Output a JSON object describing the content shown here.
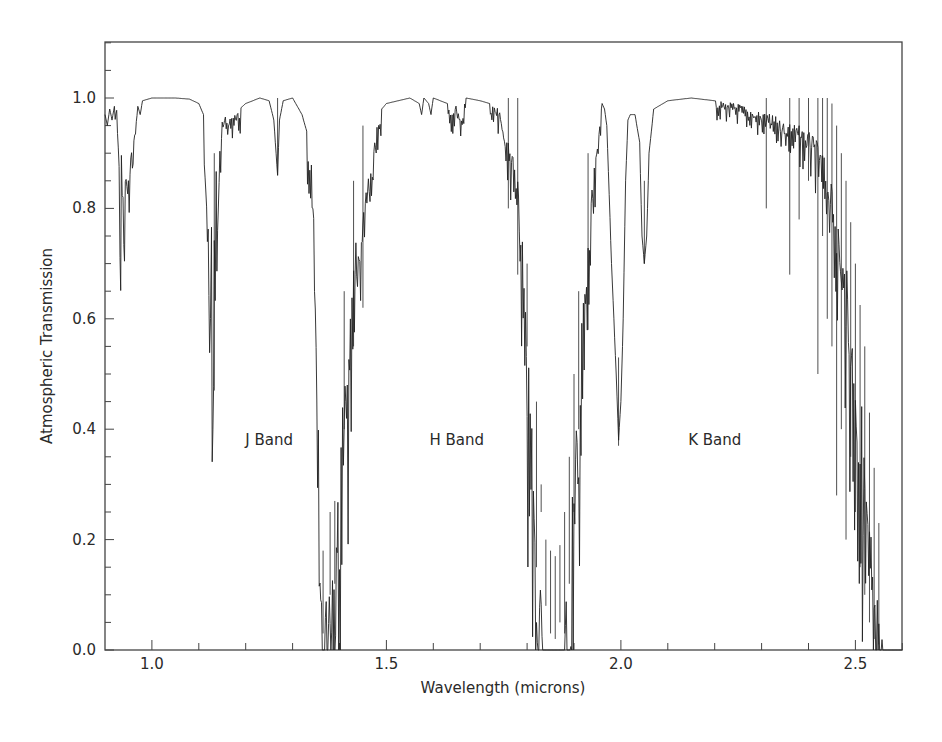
{
  "chart_data": {
    "type": "line",
    "title": "",
    "xlabel": "Wavelength (microns)",
    "ylabel": "Atmospheric Transmission",
    "xlim": [
      0.9,
      2.6
    ],
    "ylim": [
      0.0,
      1.1
    ],
    "grid": false,
    "legend": null,
    "x_ticks": [
      {
        "value": 1.0,
        "label": "1.0"
      },
      {
        "value": 1.5,
        "label": "1.5"
      },
      {
        "value": 2.0,
        "label": "2.0"
      },
      {
        "value": 2.5,
        "label": "2.5"
      }
    ],
    "x_minor_step": 0.1,
    "y_ticks": [
      {
        "value": 0.0,
        "label": "0.0"
      },
      {
        "value": 0.2,
        "label": "0.2"
      },
      {
        "value": 0.4,
        "label": "0.4"
      },
      {
        "value": 0.6,
        "label": "0.6"
      },
      {
        "value": 0.8,
        "label": "0.8"
      },
      {
        "value": 1.0,
        "label": "1.0"
      }
    ],
    "y_minor_step": 0.05,
    "annotations": [
      {
        "text": "J Band",
        "x": 1.25,
        "y": 0.38
      },
      {
        "text": "H Band",
        "x": 1.65,
        "y": 0.38
      },
      {
        "text": "K Band",
        "x": 2.2,
        "y": 0.38
      }
    ],
    "series": [
      {
        "name": "Atmospheric Transmission",
        "color": "#222222",
        "envelope": [
          [
            0.9,
            0.97
          ],
          [
            0.905,
            0.95
          ],
          [
            0.91,
            0.98
          ],
          [
            0.915,
            0.96
          ],
          [
            0.92,
            0.985
          ],
          [
            0.925,
            0.98
          ],
          [
            0.93,
            0.9
          ],
          [
            0.932,
            0.72
          ],
          [
            0.935,
            0.92
          ],
          [
            0.94,
            0.8
          ],
          [
            0.945,
            0.88
          ],
          [
            0.95,
            0.86
          ],
          [
            0.955,
            0.9
          ],
          [
            0.96,
            0.92
          ],
          [
            0.965,
            0.96
          ],
          [
            0.97,
            0.985
          ],
          [
            0.975,
            0.97
          ],
          [
            0.98,
            0.995
          ],
          [
            1.0,
            1.0
          ],
          [
            1.05,
            1.0
          ],
          [
            1.08,
            0.998
          ],
          [
            1.1,
            0.99
          ],
          [
            1.11,
            0.97
          ],
          [
            1.115,
            0.85
          ],
          [
            1.12,
            0.8
          ],
          [
            1.123,
            0.62
          ],
          [
            1.127,
            0.78
          ],
          [
            1.13,
            0.47
          ],
          [
            1.133,
            0.75
          ],
          [
            1.137,
            0.88
          ],
          [
            1.14,
            0.8
          ],
          [
            1.145,
            0.92
          ],
          [
            1.15,
            0.96
          ],
          [
            1.16,
            0.97
          ],
          [
            1.18,
            0.975
          ],
          [
            1.2,
            0.99
          ],
          [
            1.23,
            1.0
          ],
          [
            1.25,
            0.995
          ],
          [
            1.26,
            0.96
          ],
          [
            1.268,
            0.86
          ],
          [
            1.272,
            0.96
          ],
          [
            1.28,
            0.995
          ],
          [
            1.3,
            1.0
          ],
          [
            1.31,
            0.985
          ],
          [
            1.32,
            0.97
          ],
          [
            1.33,
            0.94
          ],
          [
            1.34,
            0.88
          ],
          [
            1.345,
            0.8
          ],
          [
            1.35,
            0.65
          ],
          [
            1.355,
            0.4
          ],
          [
            1.36,
            0.22
          ],
          [
            1.365,
            0.03
          ],
          [
            1.37,
            0.2
          ],
          [
            1.38,
            0.1
          ],
          [
            1.385,
            0.3
          ],
          [
            1.39,
            0.12
          ],
          [
            1.4,
            0.35
          ],
          [
            1.41,
            0.5
          ],
          [
            1.42,
            0.55
          ],
          [
            1.43,
            0.7
          ],
          [
            1.44,
            0.78
          ],
          [
            1.45,
            0.8
          ],
          [
            1.46,
            0.85
          ],
          [
            1.47,
            0.9
          ],
          [
            1.48,
            0.96
          ],
          [
            1.49,
            0.98
          ],
          [
            1.5,
            0.99
          ],
          [
            1.55,
            1.0
          ],
          [
            1.57,
            0.99
          ],
          [
            1.575,
            0.97
          ],
          [
            1.58,
            1.0
          ],
          [
            1.59,
            0.99
          ],
          [
            1.595,
            0.97
          ],
          [
            1.6,
            1.0
          ],
          [
            1.63,
            0.99
          ],
          [
            1.64,
            0.98
          ],
          [
            1.65,
            0.99
          ],
          [
            1.66,
            0.97
          ],
          [
            1.67,
            1.0
          ],
          [
            1.7,
            0.995
          ],
          [
            1.72,
            0.99
          ],
          [
            1.74,
            0.98
          ],
          [
            1.75,
            0.95
          ],
          [
            1.77,
            0.9
          ],
          [
            1.78,
            0.85
          ],
          [
            1.79,
            0.75
          ],
          [
            1.8,
            0.55
          ],
          [
            1.81,
            0.45
          ],
          [
            1.82,
            0.3
          ],
          [
            1.83,
            0.15
          ],
          [
            1.84,
            0.05
          ],
          [
            1.85,
            0.03
          ],
          [
            1.86,
            0.02
          ],
          [
            1.87,
            0.04
          ],
          [
            1.88,
            0.1
          ],
          [
            1.89,
            0.2
          ],
          [
            1.9,
            0.35
          ],
          [
            1.91,
            0.5
          ],
          [
            1.92,
            0.65
          ],
          [
            1.93,
            0.75
          ],
          [
            1.94,
            0.85
          ],
          [
            1.95,
            0.92
          ],
          [
            1.955,
            0.97
          ],
          [
            1.96,
            0.99
          ],
          [
            1.965,
            0.98
          ],
          [
            1.97,
            0.95
          ],
          [
            1.98,
            0.7
          ],
          [
            1.99,
            0.5
          ],
          [
            1.995,
            0.38
          ],
          [
            2.0,
            0.45
          ],
          [
            2.005,
            0.6
          ],
          [
            2.01,
            0.85
          ],
          [
            2.015,
            0.96
          ],
          [
            2.02,
            0.97
          ],
          [
            2.03,
            0.97
          ],
          [
            2.04,
            0.92
          ],
          [
            2.045,
            0.75
          ],
          [
            2.05,
            0.7
          ],
          [
            2.055,
            0.75
          ],
          [
            2.06,
            0.9
          ],
          [
            2.07,
            0.98
          ],
          [
            2.1,
            0.995
          ],
          [
            2.15,
            1.0
          ],
          [
            2.2,
            0.995
          ],
          [
            2.25,
            0.99
          ],
          [
            2.28,
            0.98
          ],
          [
            2.3,
            0.975
          ],
          [
            2.32,
            0.97
          ],
          [
            2.35,
            0.96
          ],
          [
            2.38,
            0.95
          ],
          [
            2.4,
            0.94
          ],
          [
            2.42,
            0.92
          ],
          [
            2.44,
            0.88
          ],
          [
            2.46,
            0.8
          ],
          [
            2.48,
            0.7
          ],
          [
            2.5,
            0.55
          ],
          [
            2.52,
            0.4
          ],
          [
            2.53,
            0.28
          ],
          [
            2.54,
            0.18
          ],
          [
            2.55,
            0.08
          ],
          [
            2.56,
            0.03
          ],
          [
            2.57,
            0.01
          ],
          [
            2.58,
            0.0
          ],
          [
            2.6,
            0.0
          ]
        ],
        "absorption_lines": [
          [
            1.133,
            0.47
          ],
          [
            1.268,
            0.86
          ],
          [
            1.365,
            0.03
          ],
          [
            1.38,
            0.1
          ],
          [
            1.39,
            0.12
          ],
          [
            1.41,
            0.4
          ],
          [
            1.43,
            0.55
          ],
          [
            1.45,
            0.62
          ],
          [
            1.76,
            0.8
          ],
          [
            1.78,
            0.68
          ],
          [
            1.8,
            0.55
          ],
          [
            1.82,
            0.15
          ],
          [
            1.83,
            0.25
          ],
          [
            1.84,
            0.08
          ],
          [
            1.85,
            0.03
          ],
          [
            1.86,
            0.02
          ],
          [
            1.87,
            0.05
          ],
          [
            1.88,
            0.03
          ],
          [
            1.89,
            0.12
          ],
          [
            1.9,
            0.25
          ],
          [
            1.91,
            0.4
          ],
          [
            1.93,
            0.58
          ],
          [
            1.995,
            0.37
          ],
          [
            2.05,
            0.7
          ],
          [
            2.31,
            0.8
          ],
          [
            2.36,
            0.68
          ],
          [
            2.38,
            0.78
          ],
          [
            2.4,
            0.85
          ],
          [
            2.42,
            0.5
          ],
          [
            2.43,
            0.75
          ],
          [
            2.44,
            0.6
          ],
          [
            2.45,
            0.55
          ],
          [
            2.46,
            0.28
          ],
          [
            2.47,
            0.4
          ],
          [
            2.48,
            0.2
          ],
          [
            2.49,
            0.35
          ],
          [
            2.5,
            0.25
          ],
          [
            2.51,
            0.15
          ],
          [
            2.52,
            0.1
          ],
          [
            2.53,
            0.05
          ],
          [
            2.54,
            0.02
          ],
          [
            2.55,
            0.01
          ]
        ]
      }
    ]
  }
}
